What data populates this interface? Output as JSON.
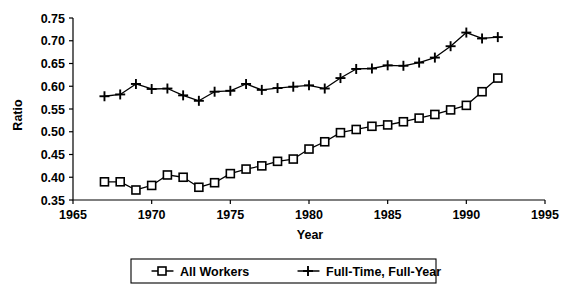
{
  "chart_data": {
    "type": "line",
    "title": "",
    "xlabel": "Year",
    "ylabel": "Ratio",
    "xlim": [
      1965,
      1995
    ],
    "ylim": [
      0.35,
      0.75
    ],
    "xticks": [
      1965,
      1970,
      1975,
      1980,
      1985,
      1990,
      1995
    ],
    "xtick_labels": [
      "1965",
      "1970",
      "1975",
      "1980",
      "1985",
      "1990",
      "1995"
    ],
    "yticks": [
      0.35,
      0.4,
      0.45,
      0.5,
      0.55,
      0.6,
      0.65,
      0.7,
      0.75
    ],
    "ytick_labels": [
      "0.35",
      "0.40",
      "0.45",
      "0.50",
      "0.55",
      "0.60",
      "0.65",
      "0.70",
      "0.75"
    ],
    "grid": false,
    "legend_position": "bottom",
    "x": [
      1967,
      1968,
      1969,
      1970,
      1971,
      1972,
      1973,
      1974,
      1975,
      1976,
      1977,
      1978,
      1979,
      1980,
      1981,
      1982,
      1983,
      1984,
      1985,
      1986,
      1987,
      1988,
      1989,
      1990,
      1991,
      1992
    ],
    "series": [
      {
        "name": "All Workers",
        "marker": "square",
        "values": [
          0.39,
          0.39,
          0.372,
          0.382,
          0.405,
          0.4,
          0.378,
          0.388,
          0.408,
          0.418,
          0.425,
          0.435,
          0.44,
          0.462,
          0.478,
          0.498,
          0.505,
          0.512,
          0.515,
          0.522,
          0.53,
          0.538,
          0.548,
          0.558,
          0.588,
          0.618
        ]
      },
      {
        "name": "Full-Time, Full-Year",
        "marker": "plus",
        "values": [
          0.578,
          0.582,
          0.605,
          0.594,
          0.595,
          0.58,
          0.568,
          0.588,
          0.59,
          0.605,
          0.592,
          0.596,
          0.599,
          0.602,
          0.595,
          0.618,
          0.638,
          0.639,
          0.646,
          0.645,
          0.652,
          0.663,
          0.688,
          0.718,
          0.705,
          0.708
        ]
      }
    ]
  },
  "legend": {
    "items": [
      {
        "label": "All Workers",
        "marker": "square"
      },
      {
        "label": "Full-Time, Full-Year",
        "marker": "plus"
      }
    ]
  },
  "colors": {
    "line": "#000000",
    "background": "#ffffff",
    "marker_fill": "#ffffff"
  }
}
